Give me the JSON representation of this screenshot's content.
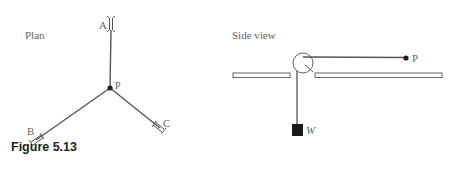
{
  "figure": {
    "caption": "Figure 5.13",
    "plan": {
      "title": "Plan",
      "labels": {
        "a": "A",
        "b": "B",
        "c": "C",
        "p": "P"
      }
    },
    "side_view": {
      "title": "Side view",
      "labels": {
        "p": "P",
        "w": "W"
      }
    },
    "colors": {
      "line": "#444444",
      "mass": "#1a1a1a",
      "text": "#666666"
    }
  }
}
